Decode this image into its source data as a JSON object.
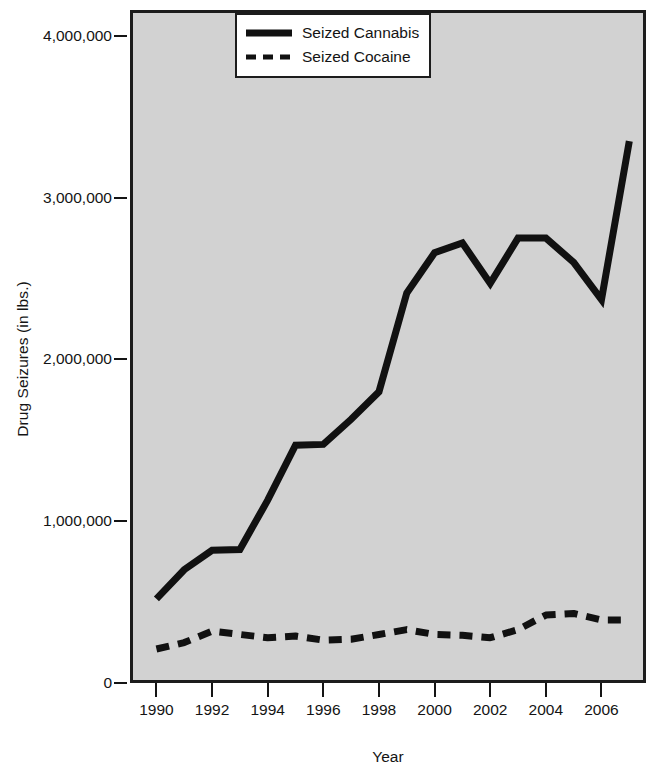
{
  "chart_data": {
    "type": "line",
    "title": "",
    "xlabel": "Year",
    "ylabel": "Drug Seizures (in lbs.)",
    "xlim": [
      1989.05,
      2007.6
    ],
    "ylim": [
      0,
      4160000
    ],
    "grid": false,
    "legend_position": "top-right",
    "x": [
      1990,
      1991,
      1992,
      1993,
      1994,
      1995,
      1996,
      1997,
      1998,
      1999,
      2000,
      2001,
      2002,
      2003,
      2004,
      2005,
      2006,
      2007
    ],
    "x_tick_labels": [
      "1990",
      "1992",
      "1994",
      "1996",
      "1998",
      "2000",
      "2002",
      "2004",
      "2006"
    ],
    "x_ticks": [
      1990,
      1992,
      1994,
      1996,
      1998,
      2000,
      2002,
      2004,
      2006
    ],
    "y_ticks": [
      0,
      1000000,
      2000000,
      3000000,
      4000000
    ],
    "y_tick_labels": [
      "0",
      "1,000,000",
      "2,000,000",
      "3,000,000",
      "4,000,000"
    ],
    "series": [
      {
        "name": "Seized Cannabis",
        "style": "solid",
        "color": "#111111",
        "values": [
          520000,
          700000,
          820000,
          825000,
          1130000,
          1470000,
          1475000,
          1630000,
          1800000,
          2410000,
          2660000,
          2720000,
          2470000,
          2750000,
          2750000,
          2600000,
          2370000,
          3350000
        ]
      },
      {
        "name": "Seized Cocaine",
        "style": "dashed",
        "color": "#111111",
        "values": [
          210000,
          250000,
          320000,
          300000,
          280000,
          290000,
          265000,
          270000,
          300000,
          330000,
          300000,
          295000,
          280000,
          330000,
          420000,
          430000,
          390000,
          390000
        ]
      }
    ]
  },
  "legend": {
    "items": [
      {
        "label": "Seized Cannabis",
        "style": "solid"
      },
      {
        "label": "Seized Cocaine",
        "style": "dashed"
      }
    ]
  },
  "axes": {
    "y_title": "Drug Seizures (in lbs.)",
    "x_title": "Year"
  },
  "colors": {
    "plot_background": "#d2d2d2",
    "axis": "#1c1c1c",
    "line": "#111111",
    "page_background": "#ffffff"
  }
}
